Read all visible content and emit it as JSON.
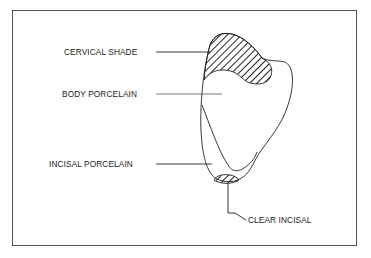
{
  "figure": {
    "type": "dental crown porcelain layering diagram",
    "labels": {
      "cervical_shade": "CERVICAL SHADE",
      "body_porcelain": "BODY PORCELAIN",
      "incisal_porcelain": "INCISAL PORCELAIN",
      "clear_incisal": "CLEAR INCISAL"
    },
    "colors": {
      "line": "#222222",
      "frame": "#555555",
      "background": "#ffffff"
    }
  }
}
